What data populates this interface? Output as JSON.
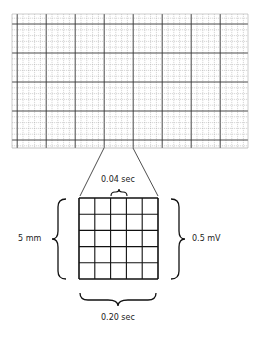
{
  "figure": {
    "labels": {
      "small_box_time": "0.04 sec",
      "large_box_height": "5 mm",
      "large_box_voltage": "0.5 mV",
      "large_box_time": "0.20 sec"
    },
    "grid": {
      "large_squares_x": 8,
      "large_squares_y": 4.6,
      "small_per_large": 5,
      "line_color": "#333333",
      "minor_color": "#9a9a9a"
    },
    "enlarged_box": {
      "rows": 5,
      "cols": 5
    }
  }
}
